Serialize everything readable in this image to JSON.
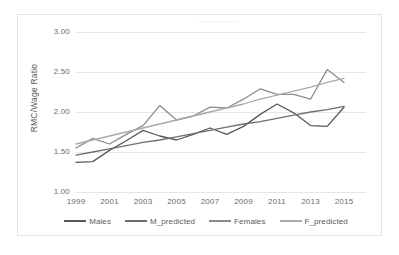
{
  "chart_data": {
    "type": "line",
    "title": "",
    "xlabel": "",
    "ylabel": "RMC/Wage Ratio",
    "x": [
      1999,
      2000,
      2001,
      2002,
      2003,
      2004,
      2005,
      2006,
      2007,
      2008,
      2009,
      2010,
      2011,
      2012,
      2013,
      2014,
      2015
    ],
    "xtick_labels": [
      "1999",
      "2001",
      "2003",
      "2005",
      "2007",
      "2009",
      "2011",
      "2013",
      "2015"
    ],
    "xticks": [
      1999,
      2001,
      2003,
      2005,
      2007,
      2009,
      2011,
      2013,
      2015
    ],
    "ytick_labels": [
      "1.00",
      "1.50",
      "2.00",
      "2.50",
      "3.00"
    ],
    "yticks": [
      1.0,
      1.5,
      2.0,
      2.5,
      3.0
    ],
    "ylim": [
      1.0,
      3.0
    ],
    "xlim": [
      1999,
      2015
    ],
    "grid": "horizontal",
    "legend_position": "bottom",
    "series": [
      {
        "name": "Males",
        "color": "#595959",
        "values": [
          1.37,
          1.38,
          1.52,
          1.64,
          1.77,
          1.7,
          1.65,
          1.72,
          1.8,
          1.72,
          1.82,
          1.97,
          2.1,
          1.99,
          1.83,
          1.82,
          2.06
        ]
      },
      {
        "name": "M_predicted",
        "color": "#6e6e6e",
        "values": [
          1.46,
          1.5,
          1.54,
          1.58,
          1.62,
          1.65,
          1.69,
          1.73,
          1.77,
          1.81,
          1.85,
          1.88,
          1.92,
          1.96,
          2.0,
          2.03,
          2.07
        ]
      },
      {
        "name": "Females",
        "color": "#8c8c8c",
        "values": [
          1.55,
          1.67,
          1.6,
          1.72,
          1.83,
          2.08,
          1.9,
          1.95,
          2.06,
          2.05,
          2.16,
          2.29,
          2.22,
          2.22,
          2.16,
          2.53,
          2.37
        ]
      },
      {
        "name": "F_predicted",
        "color": "#a9a9a9",
        "values": [
          1.6,
          1.65,
          1.7,
          1.75,
          1.8,
          1.85,
          1.9,
          1.95,
          2.0,
          2.05,
          2.1,
          2.16,
          2.21,
          2.26,
          2.31,
          2.37,
          2.42
        ]
      }
    ]
  },
  "legend": {
    "items": [
      {
        "label": "Males"
      },
      {
        "label": "M_predicted"
      },
      {
        "label": "Females"
      },
      {
        "label": "F_predicted"
      }
    ]
  }
}
